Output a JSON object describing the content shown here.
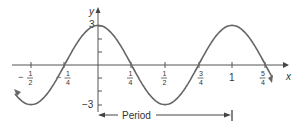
{
  "chart_data": {
    "type": "line",
    "title": "",
    "function": "y = 3 cos(2πx)",
    "xlabel": "x",
    "ylabel": "y",
    "x_ticks": [
      "-1/2",
      "-1/4",
      "1/4",
      "1/2",
      "3/4",
      "1",
      "5/4"
    ],
    "x_tick_values": [
      -0.5,
      -0.25,
      0.25,
      0.5,
      0.75,
      1,
      1.25
    ],
    "y_ticks": [
      "3",
      "-3"
    ],
    "y_tick_values": [
      3,
      -3
    ],
    "xlim": [
      -0.72,
      1.45
    ],
    "ylim": [
      -3.6,
      3.6
    ],
    "amplitude": 3,
    "period": 1,
    "series": [
      {
        "name": "curve",
        "x": [
          -0.62,
          -0.5,
          -0.25,
          0,
          0.25,
          0.5,
          0.75,
          1,
          1.25,
          1.3
        ],
        "y": [
          -2.2,
          -3,
          0,
          3,
          0,
          -3,
          0,
          3,
          0,
          -0.93
        ]
      }
    ],
    "annotations": [
      {
        "text": "Period",
        "from_x": 0,
        "to_x": 1
      }
    ],
    "grid": false,
    "legend": "none"
  },
  "labels": {
    "y_axis": "y",
    "x_axis": "x",
    "y_max": "3",
    "y_min": "−3",
    "period": "Period",
    "one": "1",
    "neg": "−",
    "num1": "1",
    "den2": "2",
    "den4": "4",
    "num3": "3",
    "num5": "5"
  },
  "colors": {
    "curve": "#666666",
    "axis": "#444444",
    "text": "#333333"
  }
}
